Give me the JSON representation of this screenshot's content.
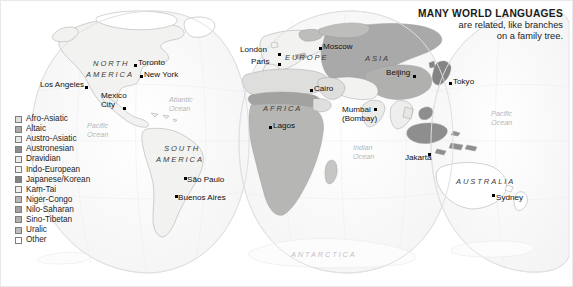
{
  "figure": {
    "name": "world-language-families-map",
    "projection": "interrupted-goode-homolosine",
    "background_color": "#ffffff",
    "border_color": "#e9e9ec"
  },
  "title": {
    "main": "MANY WORLD LANGUAGES",
    "subtitle_line_1": "are related, like branches",
    "subtitle_line_2": "on a family tree."
  },
  "legend": {
    "name": "language-family-legend",
    "items": [
      {
        "label": "Afro-Asiatic",
        "color": "#dededc"
      },
      {
        "label": "Altaic",
        "color": "#a9a9a9"
      },
      {
        "label": "Austro-Asiatic",
        "color": "#e7e7e5"
      },
      {
        "label": "Austronesian",
        "color": "#8e8e8e"
      },
      {
        "label": "Dravidian",
        "color": "#ebebe9"
      },
      {
        "label": "Indo-European",
        "color": "#f2f2f0"
      },
      {
        "label": "Japanese/Korean",
        "color": "#848484"
      },
      {
        "label": "Kam-Tai",
        "color": "#eeeeec"
      },
      {
        "label": "Niger-Congo",
        "color": "#b6b6b4"
      },
      {
        "label": "Nilo-Saharan",
        "color": "#a2a2a0"
      },
      {
        "label": "Sino-Tibetan",
        "color": "#b0b0ae"
      },
      {
        "label": "Uralic",
        "color": "#bdbdbb"
      },
      {
        "label": "Other",
        "color": "#ffffff"
      }
    ]
  },
  "continents": [
    {
      "name": "north-america",
      "text": "NORTH",
      "x": 92,
      "y": 58
    },
    {
      "name": "north-america",
      "text": "AMERICA",
      "x": 85,
      "y": 69
    },
    {
      "name": "south-america",
      "text": "SOUTH",
      "x": 163,
      "y": 143
    },
    {
      "name": "south-america",
      "text": "AMERICA",
      "x": 155,
      "y": 154
    },
    {
      "name": "europe",
      "text": "EUROPE",
      "x": 284,
      "y": 52
    },
    {
      "name": "africa",
      "text": "AFRICA",
      "x": 262,
      "y": 103
    },
    {
      "name": "asia",
      "text": "ASIA",
      "x": 364,
      "y": 53
    },
    {
      "name": "australia",
      "text": "AUSTRALIA",
      "x": 455,
      "y": 176
    }
  ],
  "polar": {
    "name": "antarctica",
    "text": "ANTARCTICA",
    "x": 290,
    "y": 249
  },
  "oceans": [
    {
      "name": "atlantic-ocean",
      "line1": "Atlantic",
      "line2": "Ocean",
      "x": 168,
      "y": 94
    },
    {
      "name": "pacific-ocean-east",
      "line1": "Pacific",
      "line2": "Ocean",
      "x": 86,
      "y": 120
    },
    {
      "name": "indian-ocean",
      "line1": "Indian",
      "line2": "Ocean",
      "x": 352,
      "y": 142
    },
    {
      "name": "pacific-ocean-west",
      "line1": "Pacific",
      "line2": "Ocean",
      "x": 490,
      "y": 108
    }
  ],
  "cities": [
    {
      "name": "los-angeles",
      "label": "Los Angeles",
      "lx": 39,
      "ly": 79,
      "dx": 84,
      "dy": 85,
      "align": "left"
    },
    {
      "name": "toronto",
      "label": "Toronto",
      "lx": 137,
      "ly": 57,
      "dx": 133,
      "dy": 63,
      "align": "left"
    },
    {
      "name": "new-york",
      "label": "New York",
      "lx": 143,
      "ly": 69,
      "dx": 139,
      "dy": 74,
      "align": "left"
    },
    {
      "name": "mexico-city",
      "label": "Mexico",
      "label2": "City",
      "lx": 100,
      "ly": 91,
      "dx": 122,
      "dy": 106,
      "align": "left"
    },
    {
      "name": "sao-paulo",
      "label": "São Paulo",
      "lx": 186,
      "ly": 174,
      "dx": 183,
      "dy": 176,
      "align": "left"
    },
    {
      "name": "buenos-aires",
      "label": "Buenos Aires",
      "lx": 177,
      "ly": 192,
      "dx": 174,
      "dy": 194,
      "align": "left"
    },
    {
      "name": "london",
      "label": "London",
      "lx": 239,
      "ly": 44,
      "dx": 277,
      "dy": 52,
      "align": "left"
    },
    {
      "name": "paris",
      "label": "Paris",
      "lx": 250,
      "ly": 56,
      "dx": 277,
      "dy": 62,
      "align": "left"
    },
    {
      "name": "moscow",
      "label": "Moscow",
      "lx": 322,
      "ly": 41,
      "dx": 318,
      "dy": 46,
      "align": "left"
    },
    {
      "name": "cairo",
      "label": "Cairo",
      "lx": 313,
      "ly": 83,
      "dx": 309,
      "dy": 88,
      "align": "left"
    },
    {
      "name": "lagos",
      "label": "Lagos",
      "lx": 272,
      "ly": 120,
      "dx": 268,
      "dy": 125,
      "align": "left"
    },
    {
      "name": "mumbai",
      "label": "Mumbai",
      "label2": "(Bombay)",
      "lx": 341,
      "ly": 105,
      "dx": 373,
      "dy": 107,
      "align": "left"
    },
    {
      "name": "beijing",
      "label": "Beijing",
      "lx": 385,
      "ly": 67,
      "dx": 412,
      "dy": 74,
      "align": "left"
    },
    {
      "name": "tokyo",
      "label": "Tokyo",
      "lx": 452,
      "ly": 76,
      "dx": 448,
      "dy": 81,
      "align": "left"
    },
    {
      "name": "jakarta",
      "label": "Jakarta",
      "lx": 404,
      "ly": 152,
      "dx": 427,
      "dy": 152,
      "align": "left"
    },
    {
      "name": "sydney",
      "label": "Sydney",
      "lx": 495,
      "ly": 192,
      "dx": 491,
      "dy": 193,
      "align": "left"
    }
  ]
}
